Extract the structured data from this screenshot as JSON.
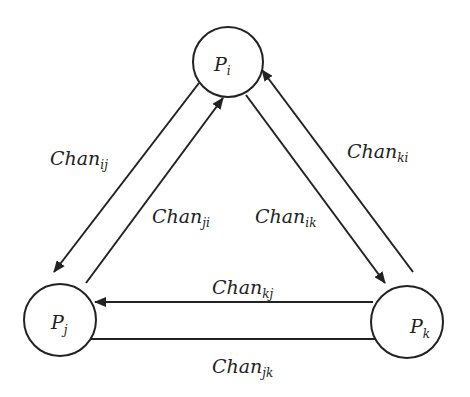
{
  "diagram": {
    "type": "process-channel-graph",
    "nodes": [
      {
        "id": "i",
        "base": "P",
        "sub": "i"
      },
      {
        "id": "j",
        "base": "P",
        "sub": "j"
      },
      {
        "id": "k",
        "base": "P",
        "sub": "k"
      }
    ],
    "edges": [
      {
        "from": "i",
        "to": "j",
        "base": "Chan",
        "sub": "ij"
      },
      {
        "from": "j",
        "to": "i",
        "base": "Chan",
        "sub": "ji"
      },
      {
        "from": "i",
        "to": "k",
        "base": "Chan",
        "sub": "ik"
      },
      {
        "from": "k",
        "to": "i",
        "base": "Chan",
        "sub": "ki"
      },
      {
        "from": "k",
        "to": "j",
        "base": "Chan",
        "sub": "kj"
      },
      {
        "from": "j",
        "to": "k",
        "base": "Chan",
        "sub": "jk"
      }
    ],
    "colors": {
      "stroke": "#222222",
      "background": "#ffffff"
    }
  }
}
